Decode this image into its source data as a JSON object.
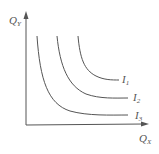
{
  "figure": {
    "type": "indifference-curves",
    "axes": {
      "y_label": "Q",
      "y_sub": "Y",
      "x_label": "Q",
      "x_sub": "X"
    },
    "curves": [
      {
        "name": "I1",
        "label": "I",
        "sub": "1"
      },
      {
        "name": "I2",
        "label": "I",
        "sub": "2"
      },
      {
        "name": "I3",
        "label": "I",
        "sub": "3"
      }
    ],
    "colors": {
      "line": "#555555",
      "text": "#555555",
      "background": "#ffffff"
    }
  }
}
